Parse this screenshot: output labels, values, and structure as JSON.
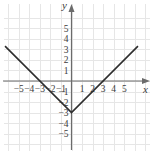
{
  "figure": {
    "name": "coordinate-plane-absolute-value-graph",
    "width": 154,
    "height": 155,
    "background_color": "#ffffff",
    "grid_color": "#e6e6e6",
    "axis_color": "#6b6b6b",
    "curve_color": "#2e2e2e",
    "label_color": "#3a3a3a"
  },
  "chart_data": {
    "type": "line",
    "title": "",
    "xlabel": "x",
    "ylabel": "y",
    "grid": true,
    "legend": null,
    "xlim": [
      -6.7,
      7.3
    ],
    "ylim": [
      -6.6,
      6.4
    ],
    "xticks": [
      -5,
      -4,
      -3,
      -2,
      -1,
      1,
      2,
      3,
      4,
      5
    ],
    "yticks": [
      5,
      4,
      3,
      2,
      1,
      -1,
      -2,
      -3,
      -4,
      -5
    ],
    "xtick_labels": [
      "-5",
      "-4",
      "-3",
      "-2",
      "-1",
      "1",
      "2",
      "3",
      "4",
      "5"
    ],
    "ytick_labels": [
      "5",
      "4",
      "3",
      "2",
      "1",
      "-1",
      "-2",
      "-3",
      "-4",
      "-5"
    ],
    "series": [
      {
        "name": "y = |x| - 3",
        "equation": "y = |x| - 3",
        "shape": "v",
        "vertex": [
          0,
          -3
        ],
        "x_intercepts": [
          -3,
          3
        ],
        "y_intercept": -3,
        "slope_left": -1,
        "slope_right": 1,
        "x": [
          -6.3,
          0,
          6.3
        ],
        "values": [
          3.3,
          -3,
          3.3
        ]
      }
    ],
    "annotations": []
  }
}
